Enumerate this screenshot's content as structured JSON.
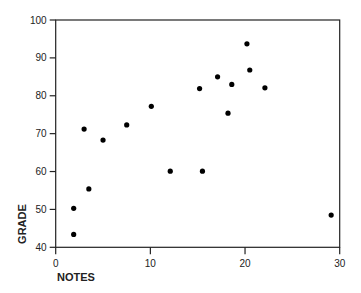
{
  "chart_data": {
    "type": "scatter",
    "title": "",
    "xlabel": "NOTES",
    "ylabel": "GRADE",
    "xlim": [
      0,
      30
    ],
    "ylim": [
      40,
      100
    ],
    "xticks": [
      0,
      10,
      20,
      30
    ],
    "yticks": [
      40,
      50,
      60,
      70,
      80,
      90,
      100
    ],
    "grid": false,
    "legend": null,
    "marker_color": "#000000",
    "points": [
      {
        "x": 1.9,
        "y": 43.4
      },
      {
        "x": 1.9,
        "y": 50.3
      },
      {
        "x": 3.0,
        "y": 71.2
      },
      {
        "x": 3.5,
        "y": 55.4
      },
      {
        "x": 5.0,
        "y": 68.3
      },
      {
        "x": 7.5,
        "y": 72.3
      },
      {
        "x": 10.1,
        "y": 77.2
      },
      {
        "x": 12.1,
        "y": 60.1
      },
      {
        "x": 15.2,
        "y": 81.9
      },
      {
        "x": 15.5,
        "y": 60.1
      },
      {
        "x": 17.1,
        "y": 85.0
      },
      {
        "x": 18.2,
        "y": 75.4
      },
      {
        "x": 18.6,
        "y": 83.0
      },
      {
        "x": 20.2,
        "y": 93.7
      },
      {
        "x": 20.5,
        "y": 86.8
      },
      {
        "x": 22.1,
        "y": 82.1
      },
      {
        "x": 29.1,
        "y": 48.5
      }
    ]
  }
}
